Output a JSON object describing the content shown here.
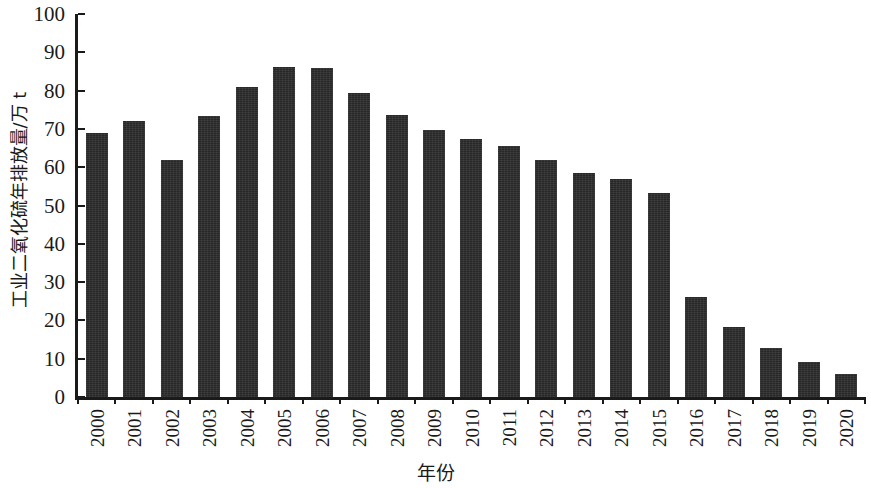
{
  "chart_data": {
    "type": "bar",
    "title": "",
    "xlabel": "年份",
    "ylabel": "工业二氧化硫年排放量/万 t",
    "categories": [
      "2000",
      "2001",
      "2002",
      "2003",
      "2004",
      "2005",
      "2006",
      "2007",
      "2008",
      "2009",
      "2010",
      "2011",
      "2012",
      "2013",
      "2014",
      "2015",
      "2016",
      "2017",
      "2018",
      "2019",
      "2020"
    ],
    "values": [
      69.0,
      72.0,
      62.0,
      73.3,
      81.0,
      86.2,
      85.8,
      79.4,
      73.6,
      69.8,
      67.3,
      65.6,
      61.8,
      58.4,
      56.8,
      53.2,
      26.0,
      18.4,
      12.8,
      9.2,
      6.0
    ],
    "ylim": [
      0,
      100
    ],
    "yticks": [
      0,
      10,
      20,
      30,
      40,
      50,
      60,
      70,
      80,
      90,
      100
    ],
    "ytick_labels": [
      "0",
      "10",
      "20",
      "30",
      "40",
      "50",
      "60",
      "70",
      "80",
      "90",
      "100"
    ],
    "grid": false,
    "legend": null,
    "bar_color": "#2c2c2c",
    "axis_color": "#1a1a1a",
    "background_color": "#ffffff"
  }
}
